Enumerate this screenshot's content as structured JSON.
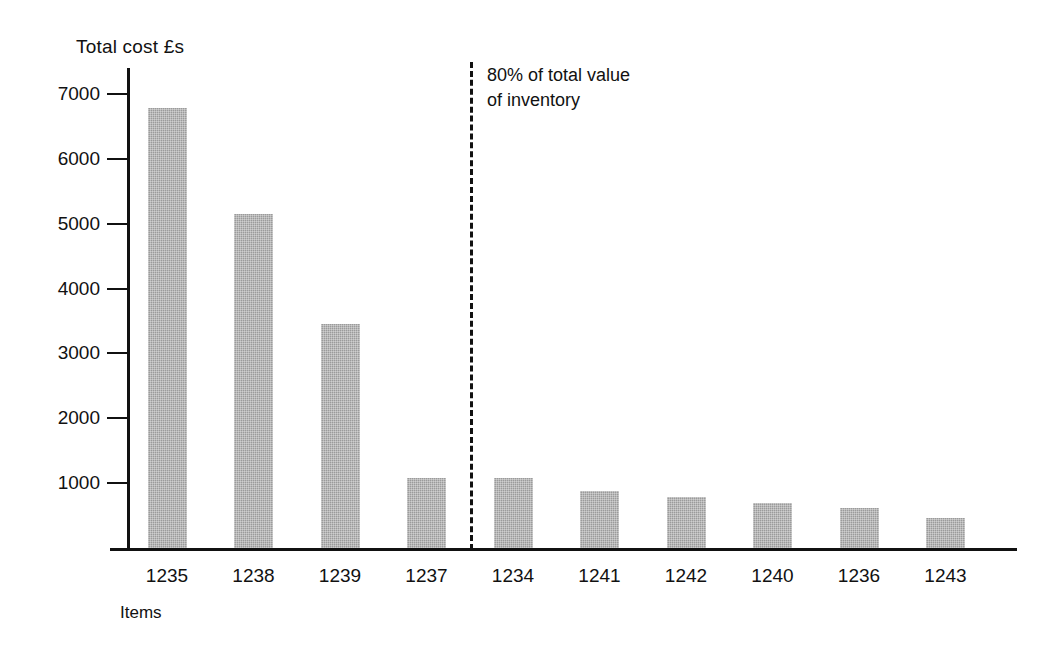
{
  "chart_data": {
    "type": "bar",
    "title": "Total cost £s",
    "xlabel": "Items",
    "ylabel": "Total cost £s",
    "categories": [
      "1235",
      "1238",
      "1239",
      "1237",
      "1234",
      "1241",
      "1242",
      "1240",
      "1236",
      "1243"
    ],
    "values": [
      6780,
      5150,
      3450,
      1080,
      1080,
      880,
      790,
      690,
      620,
      460
    ],
    "ylim": [
      0,
      7400
    ],
    "yticks": [
      1000,
      2000,
      3000,
      4000,
      5000,
      6000,
      7000
    ],
    "ytick_labels": [
      "1000",
      "2000",
      "3000",
      "4000",
      "5000",
      "6000",
      "7000"
    ],
    "grid": false,
    "legend": null,
    "bar_color": "#9b9b9b",
    "axis_color": "#111111",
    "annotations": [
      {
        "text_line_1": "80% of total value",
        "text_line_2": "of inventory",
        "after_category_index": 3,
        "style": "dashed-vertical-line"
      }
    ]
  },
  "chart": {
    "axis_title": "Total cost £s",
    "x_axis_title": "Items",
    "annotation_line_1": "80% of total value",
    "annotation_line_2": "of inventory"
  }
}
